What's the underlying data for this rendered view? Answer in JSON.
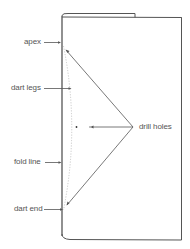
{
  "diagram": {
    "type": "dart-on-folded-fabric",
    "labels": {
      "apex": "apex",
      "dart_legs": "dart legs",
      "fold_line": "fold line",
      "dart_end": "dart end",
      "drill_holes": "drill holes"
    },
    "colors": {
      "line": "#555555",
      "label_text": "#555555",
      "dotted_line": "#bbbbbb",
      "background": "#ffffff"
    }
  }
}
